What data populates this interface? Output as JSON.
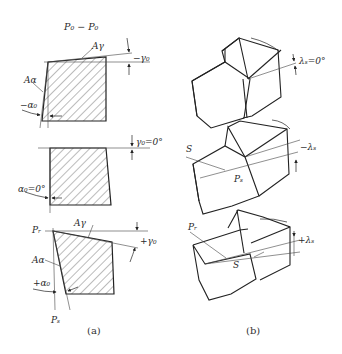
{
  "figure": {
    "panel_a": {
      "title": "P₀ − P₀",
      "caption": "(a)",
      "sections": [
        {
          "id": "negative",
          "rake_face_label": "Aγ",
          "flank_face_label": "Aα",
          "rake_angle_label": "−γ₀",
          "clearance_angle_label": "−α₀"
        },
        {
          "id": "zero",
          "rake_angle_label": "γ₀=0°",
          "clearance_angle_label": "α₀=0°"
        },
        {
          "id": "positive",
          "base_plane_label": "Pᵣ",
          "rake_face_label": "Aγ",
          "flank_face_label": "Aα",
          "rake_angle_label": "+γ₀",
          "clearance_angle_label": "+α₀",
          "cutting_plane_label": "Pₛ"
        }
      ]
    },
    "panel_b": {
      "caption": "(b)",
      "tools": [
        {
          "id": "zero",
          "inclination_label": "λₛ=0°"
        },
        {
          "id": "negative",
          "edge_label": "S",
          "plane_label": "Pₛ",
          "inclination_label": "−λₛ"
        },
        {
          "id": "positive",
          "base_plane_label": "Pᵣ",
          "edge_label": "S",
          "inclination_label": "+λₛ"
        }
      ]
    }
  },
  "colors": {
    "line": "#222222",
    "hatch": "#555555",
    "thin": "#444444",
    "background": "#ffffff"
  }
}
